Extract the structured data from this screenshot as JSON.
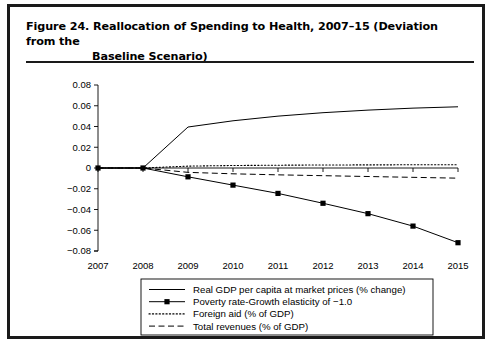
{
  "figure": {
    "title_line1": "Figure 24.  Reallocation of Spending to Health, 2007–15 (Deviation from the",
    "title_line2": "Baseline Scenario)"
  },
  "chart_data": {
    "type": "line",
    "title": "Reallocation of Spending to Health, 2007–15 (Deviation from the Baseline Scenario)",
    "xlabel": "",
    "ylabel": "",
    "categories": [
      "2007",
      "2008",
      "2009",
      "2010",
      "2011",
      "2012",
      "2013",
      "2014",
      "2015"
    ],
    "x": [
      2007,
      2008,
      2009,
      2010,
      2011,
      2012,
      2013,
      2014,
      2015
    ],
    "xlim": [
      2007,
      2015
    ],
    "ylim": [
      -0.08,
      0.08
    ],
    "yticks": [
      0.08,
      0.06,
      0.04,
      0.02,
      0,
      -0.02,
      -0.04,
      -0.06,
      -0.08
    ],
    "ytick_labels": [
      "0.08",
      "0.06",
      "0.04",
      "0.02",
      "0",
      "−0.02",
      "−0.04",
      "−0.06",
      "−0.08"
    ],
    "grid": false,
    "legend_position": "bottom",
    "series": [
      {
        "name": "Real GDP per capita at market prices (% change)",
        "style": "solid",
        "marker": "none",
        "color": "#000000",
        "values": [
          0.0,
          0.0,
          0.0395,
          0.0455,
          0.05,
          0.0533,
          0.0558,
          0.0577,
          0.059
        ]
      },
      {
        "name": "Poverty rate-Growth elasticity of −1.0",
        "style": "solid",
        "marker": "square",
        "color": "#000000",
        "values": [
          0.0,
          0.0,
          -0.0085,
          -0.0165,
          -0.0245,
          -0.034,
          -0.044,
          -0.056,
          -0.072
        ]
      },
      {
        "name": "Foreign aid (% of GDP)",
        "style": "dotted",
        "marker": "none",
        "color": "#000000",
        "values": [
          0.0,
          0.0,
          0.0018,
          0.0024,
          0.0027,
          0.0029,
          0.003,
          0.0031,
          0.0032
        ]
      },
      {
        "name": "Total revenues (% of GDP)",
        "style": "dashed",
        "marker": "none",
        "color": "#000000",
        "values": [
          0.0,
          0.0,
          -0.0042,
          -0.0056,
          -0.0066,
          -0.0074,
          -0.0082,
          -0.009,
          -0.0098
        ]
      }
    ]
  },
  "legend": {
    "items": [
      {
        "label": "Real GDP per capita at market prices (% change)",
        "style": "solid",
        "marker": "none"
      },
      {
        "label": "Poverty rate-Growth elasticity of −1.0",
        "style": "solid",
        "marker": "square"
      },
      {
        "label": "Foreign aid (% of GDP)",
        "style": "dotted",
        "marker": "none"
      },
      {
        "label": "Total revenues (% of GDP)",
        "style": "dashed",
        "marker": "none"
      }
    ]
  },
  "colors": {
    "ink": "#000000",
    "frame": "#1a1a1a",
    "background": "#ffffff"
  }
}
